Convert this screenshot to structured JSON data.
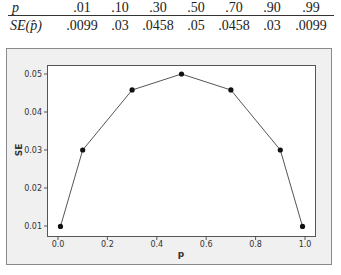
{
  "table": {
    "row1_label": "p",
    "row2_label": "SE(p̂)",
    "row2_label_prefix": "SE(",
    "row2_label_var": "p̂",
    "row2_label_suffix": ")",
    "p_values": [
      ".01",
      ".10",
      ".30",
      ".50",
      ".70",
      ".90",
      ".99"
    ],
    "se_values": [
      ".0099",
      ".03",
      ".0458",
      ".05",
      ".0458",
      ".03",
      ".0099"
    ]
  },
  "chart_data": {
    "type": "line",
    "title": "",
    "xlabel": "p",
    "ylabel": "SE",
    "x": [
      0.01,
      0.1,
      0.3,
      0.5,
      0.7,
      0.9,
      0.99
    ],
    "series": [
      {
        "name": "SE",
        "values": [
          0.0099,
          0.03,
          0.0458,
          0.05,
          0.0458,
          0.03,
          0.0099
        ]
      }
    ],
    "xticks": [
      "0.0",
      "0.2",
      "0.4",
      "0.6",
      "0.8",
      "1.0"
    ],
    "yticks": [
      "0.01",
      "0.02",
      "0.03",
      "0.04",
      "0.05"
    ],
    "xlim": [
      0.0,
      1.0
    ],
    "ylim": [
      0.01,
      0.05
    ],
    "grid": false,
    "markers": true,
    "legend": null
  },
  "colors": {
    "line": "#555555",
    "marker": "#111111",
    "panel_bg": "#f0f0f0",
    "panel_border": "#8a8a8a",
    "plot_bg": "#ffffff",
    "plot_border": "#555555"
  }
}
